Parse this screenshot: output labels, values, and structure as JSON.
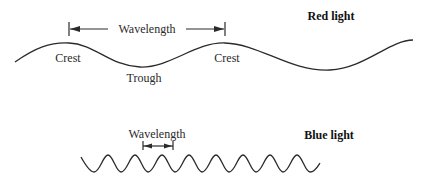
{
  "diagram": {
    "red": {
      "title": "Red light",
      "wavelength_label": "Wavelength",
      "crest_label_1": "Crest",
      "crest_label_2": "Crest",
      "trough_label": "Trough"
    },
    "blue": {
      "title": "Blue light",
      "wavelength_label": "Wavelength"
    },
    "colors": {
      "line": "#2a2a2a",
      "background": "#ffffff"
    }
  }
}
